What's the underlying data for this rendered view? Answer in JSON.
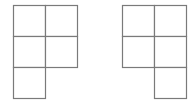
{
  "figures": [
    {
      "name": "left-pentomino",
      "origin": [
        13,
        5
      ],
      "cell": 32,
      "cells": [
        [
          0,
          0
        ],
        [
          1,
          0
        ],
        [
          0,
          1
        ],
        [
          1,
          1
        ],
        [
          0,
          2
        ]
      ]
    },
    {
      "name": "right-pentomino",
      "origin": [
        122,
        5
      ],
      "cell": 32,
      "cells": [
        [
          0,
          0
        ],
        [
          1,
          0
        ],
        [
          0,
          1
        ],
        [
          1,
          1
        ],
        [
          1,
          2
        ]
      ]
    }
  ],
  "colors": {
    "stroke": "#7a7a7a",
    "fill": "#ffffff",
    "background": "#ffffff"
  }
}
